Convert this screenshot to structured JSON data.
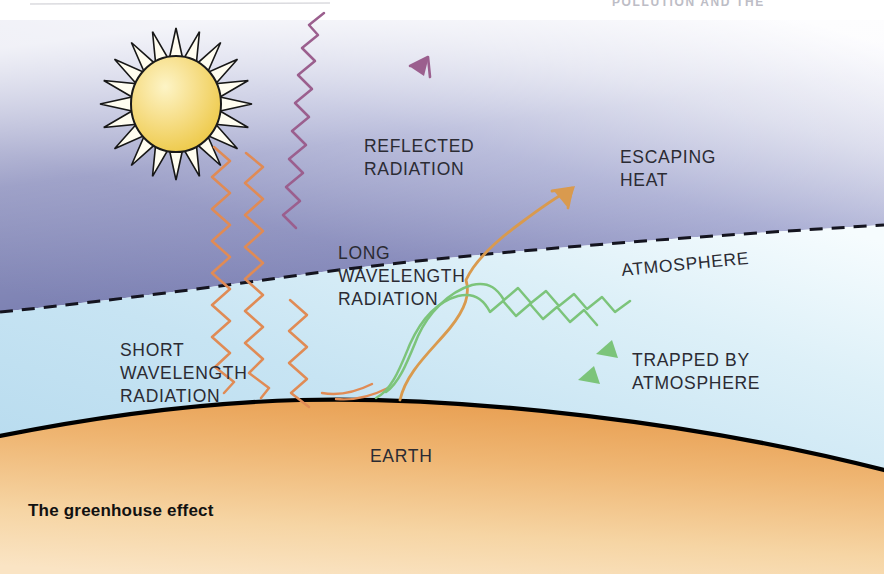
{
  "page": {
    "header_note": "POLLUTION AND THE",
    "caption": "The greenhouse effect",
    "background_color": "#ffffff"
  },
  "colors": {
    "upper_atmosphere": "#6f74ab",
    "upper_atmosphere_fade": "#f4f5fa",
    "lower_atmosphere": "#bfe0f2",
    "lower_atmosphere_fade": "#f2fafd",
    "earth_dark": "#e9a557",
    "earth_light": "#f6dcb4",
    "earth_outline": "#000000",
    "sun_fill": "#f2d14f",
    "sun_highlight": "#faeeb0",
    "sun_outline": "#1a1a1a",
    "short_wave": "#e08b55",
    "reflected_wave": "#9b5f8e",
    "escaping_wave": "#d99a4e",
    "trapped_wave": "#7cc47a",
    "boundary_dash": "#111122",
    "label_text": "#2b2b33"
  },
  "labels": {
    "reflected_radiation": [
      "REFLECTED",
      "RADIATION"
    ],
    "escaping_heat": [
      "ESCAPING",
      "HEAT"
    ],
    "atmosphere": "ATMOSPHERE",
    "long_wavelength_radiation": [
      "LONG",
      "WAVELENGTH",
      "RADIATION"
    ],
    "short_wavelength_radiation": [
      "SHORT",
      "WAVELENGTH",
      "RADIATION"
    ],
    "trapped_by_atmosphere": [
      "TRAPPED BY",
      "ATMOSPHERE"
    ],
    "earth": "EARTH"
  },
  "elements": {
    "sun": {
      "name": "sun",
      "ray_count": 20,
      "center_x": 176,
      "center_y": 104,
      "radius": 44
    },
    "atmosphere_boundary": {
      "name": "dashed-atmosphere-line",
      "style": "dashed"
    },
    "earth_surface": {
      "name": "earth-arc",
      "style": "solid-black-top-edge"
    },
    "waves": [
      {
        "name": "short-wavelength-wave-1",
        "color": "#e08b55",
        "direction": "down-right",
        "style": "zigzag"
      },
      {
        "name": "short-wavelength-wave-2",
        "color": "#e08b55",
        "direction": "down-right",
        "style": "zigzag"
      },
      {
        "name": "reflected-radiation-wave",
        "color": "#9b5f8e",
        "direction": "up-right",
        "style": "zigzag",
        "arrowhead": true
      },
      {
        "name": "escaping-heat-wave",
        "color": "#d99a4e",
        "direction": "up-right",
        "style": "smooth",
        "arrowhead": true
      },
      {
        "name": "trapped-heat-wave-1",
        "color": "#7cc47a",
        "direction": "right-down",
        "style": "mixed",
        "arrowhead": true
      },
      {
        "name": "trapped-heat-wave-2",
        "color": "#7cc47a",
        "direction": "right-down",
        "style": "mixed",
        "arrowhead": true
      }
    ]
  }
}
